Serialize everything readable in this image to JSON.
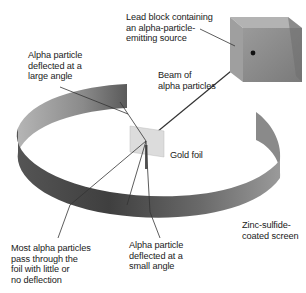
{
  "figure": {
    "labels": {
      "lead_block": "Lead block containing\nan alpha-particle-\nemitting source",
      "large_angle": "Alpha particle\ndeflected at a\nlarge angle",
      "beam": "Beam of\nalpha particles",
      "gold_foil": "Gold foil",
      "screen": "Zinc-sulfide-\ncoated screen",
      "most_pass": "Most alpha particles\npass through the\nfoil with little or\nno deflection",
      "small_angle": "Alpha particle\ndeflected at a\nsmall angle"
    },
    "colors": {
      "ring_dark": "#3f3f3f",
      "ring_mid": "#6e6e6e",
      "ring_light": "#a9a9a9",
      "cube_front": "#8c8c8c",
      "cube_top": "#b3b3b3",
      "cube_side": "#6f6f6f",
      "foil": "#d9d9d9",
      "beam": "#333333"
    }
  }
}
